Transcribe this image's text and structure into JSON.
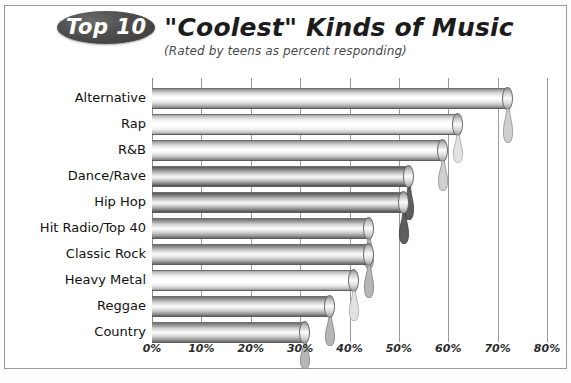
{
  "title": {
    "badge": "Top 10",
    "main": "\"Coolest\" Kinds of Music",
    "subtitle": "(Rated by teens as percent responding)"
  },
  "colors": {
    "badge_fill": "#4d4d4d",
    "badge_text": "#ffffff",
    "title_text": "#1c1c1c",
    "subtitle_text": "#4a4a4a",
    "gridline": "#9b9b9b",
    "frame_border": "#9a9a9a",
    "background": "#ffffff",
    "bar_light": "#e4e4e4",
    "bar_dark": "#7d7d7d"
  },
  "chart_data": {
    "type": "bar",
    "orientation": "horizontal",
    "title": "\"Coolest\" Kinds of Music",
    "subtitle": "(Rated by teens as percent responding)",
    "xlabel": "",
    "ylabel": "",
    "xlim": [
      0,
      80
    ],
    "grid": true,
    "legend": "none",
    "tick_labels": [
      "0%",
      "10%",
      "20%",
      "30%",
      "40%",
      "50%",
      "60%",
      "70%",
      "80%"
    ],
    "tick_values": [
      0,
      10,
      20,
      30,
      40,
      50,
      60,
      70,
      80
    ],
    "categories": [
      "Alternative",
      "Rap",
      "R&B",
      "Dance/Rave",
      "Hip Hop",
      "Hit Radio/Top 40",
      "Classic Rock",
      "Heavy Metal",
      "Reggae",
      "Country"
    ],
    "values": [
      72,
      62,
      59,
      52,
      51,
      44,
      44,
      41,
      36,
      31
    ],
    "bar_styles": [
      "light",
      "pale",
      "light",
      "dark",
      "dark",
      "mid",
      "mid",
      "pale",
      "mid",
      "mid"
    ]
  }
}
